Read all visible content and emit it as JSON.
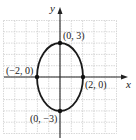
{
  "chart_data": {
    "type": "line",
    "title": "",
    "xlabel": "x",
    "ylabel": "y",
    "xlim": [
      -5,
      5
    ],
    "ylim": [
      -5,
      5
    ],
    "grid": true,
    "legend": null,
    "series": [
      {
        "name": "ellipse",
        "center": [
          0,
          0
        ],
        "semi_axis_x": 2,
        "semi_axis_y": 3,
        "color": "#1a1a1a"
      }
    ],
    "points": [
      {
        "x": 0,
        "y": 3,
        "label": "(0, 3)"
      },
      {
        "x": 2,
        "y": 0,
        "label": "(2, 0)"
      },
      {
        "x": -2,
        "y": 0,
        "label": "(−2, 0)"
      },
      {
        "x": 0,
        "y": -3,
        "label": "(0, −3)"
      }
    ]
  },
  "colors": {
    "grid": "#c8c8c8",
    "axis": "#222222",
    "curve": "#1a1a1a"
  }
}
